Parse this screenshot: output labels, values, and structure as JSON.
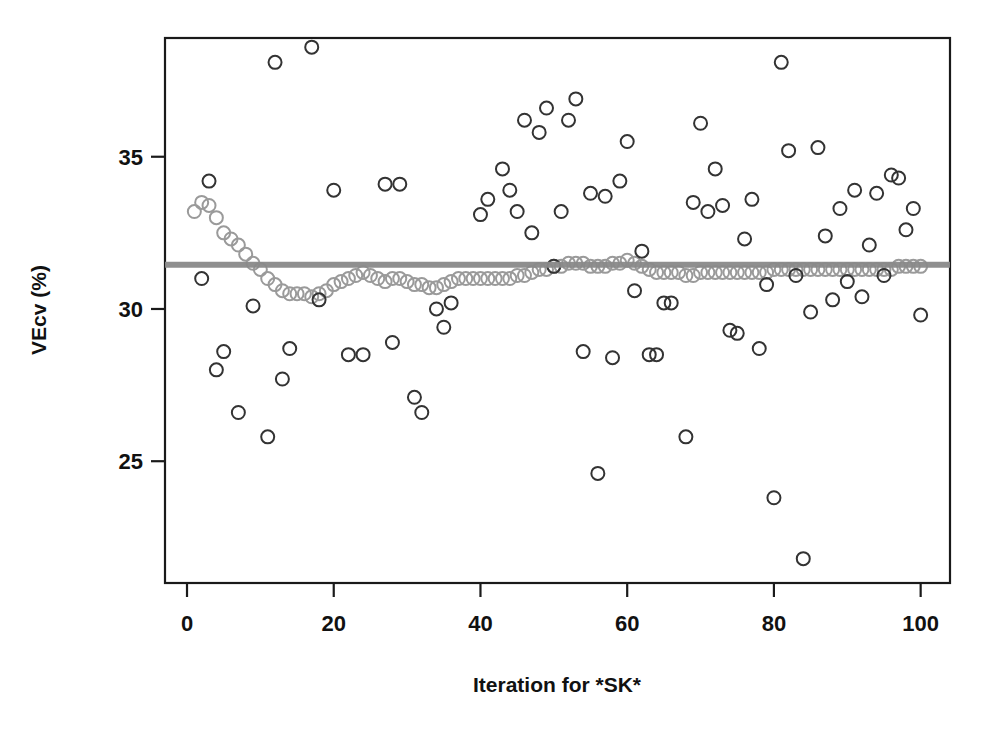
{
  "chart_data": {
    "type": "scatter",
    "title": "",
    "xlabel": "Iteration for *SK*",
    "ylabel": "VEcv (%)",
    "xlim": [
      -3,
      104
    ],
    "ylim": [
      21.0,
      38.9
    ],
    "xticks": [
      0,
      20,
      40,
      60,
      80,
      100
    ],
    "yticks": [
      25,
      30,
      35
    ],
    "grid": false,
    "legend": null,
    "colors": {
      "outlier_marker": "#333333",
      "cluster_marker": "#9a9a9a",
      "mean_line": "#8a8a8a",
      "axis": "#1a1a1a",
      "background": "#ffffff"
    },
    "marker": {
      "shape": "open-circle",
      "radius_px": 6.5,
      "stroke_width_px": 2
    },
    "reference_line": {
      "orientation": "horizontal",
      "value": 31.45,
      "label": "mean VEcv",
      "width_px": 6,
      "color": "#8a8a8a"
    },
    "series": [
      {
        "name": "cumulative mean VEcv",
        "role": "cluster",
        "color": "#9a9a9a",
        "points": [
          [
            1,
            33.2
          ],
          [
            2,
            33.5
          ],
          [
            3,
            33.4
          ],
          [
            4,
            33.0
          ],
          [
            5,
            32.5
          ],
          [
            6,
            32.3
          ],
          [
            7,
            32.1
          ],
          [
            8,
            31.8
          ],
          [
            9,
            31.5
          ],
          [
            10,
            31.3
          ],
          [
            11,
            31.0
          ],
          [
            12,
            30.8
          ],
          [
            13,
            30.6
          ],
          [
            14,
            30.5
          ],
          [
            15,
            30.5
          ],
          [
            16,
            30.5
          ],
          [
            17,
            30.4
          ],
          [
            18,
            30.5
          ],
          [
            19,
            30.6
          ],
          [
            20,
            30.8
          ],
          [
            21,
            30.9
          ],
          [
            22,
            31.0
          ],
          [
            23,
            31.1
          ],
          [
            24,
            31.2
          ],
          [
            25,
            31.1
          ],
          [
            26,
            31.0
          ],
          [
            27,
            30.9
          ],
          [
            28,
            31.0
          ],
          [
            29,
            31.0
          ],
          [
            30,
            30.9
          ],
          [
            31,
            30.8
          ],
          [
            32,
            30.8
          ],
          [
            33,
            30.7
          ],
          [
            34,
            30.7
          ],
          [
            35,
            30.8
          ],
          [
            36,
            30.9
          ],
          [
            37,
            31.0
          ],
          [
            38,
            31.0
          ],
          [
            39,
            31.0
          ],
          [
            40,
            31.0
          ],
          [
            41,
            31.0
          ],
          [
            42,
            31.0
          ],
          [
            43,
            31.0
          ],
          [
            44,
            31.0
          ],
          [
            45,
            31.1
          ],
          [
            46,
            31.1
          ],
          [
            47,
            31.2
          ],
          [
            48,
            31.3
          ],
          [
            49,
            31.3
          ],
          [
            50,
            31.4
          ],
          [
            51,
            31.4
          ],
          [
            52,
            31.5
          ],
          [
            53,
            31.5
          ],
          [
            54,
            31.5
          ],
          [
            55,
            31.4
          ],
          [
            56,
            31.4
          ],
          [
            57,
            31.4
          ],
          [
            58,
            31.5
          ],
          [
            59,
            31.5
          ],
          [
            60,
            31.6
          ],
          [
            61,
            31.5
          ],
          [
            62,
            31.4
          ],
          [
            63,
            31.3
          ],
          [
            64,
            31.2
          ],
          [
            65,
            31.2
          ],
          [
            66,
            31.2
          ],
          [
            67,
            31.2
          ],
          [
            68,
            31.1
          ],
          [
            69,
            31.1
          ],
          [
            70,
            31.2
          ],
          [
            71,
            31.2
          ],
          [
            72,
            31.2
          ],
          [
            73,
            31.2
          ],
          [
            74,
            31.2
          ],
          [
            75,
            31.2
          ],
          [
            76,
            31.2
          ],
          [
            77,
            31.2
          ],
          [
            78,
            31.2
          ],
          [
            79,
            31.2
          ],
          [
            80,
            31.3
          ],
          [
            81,
            31.3
          ],
          [
            82,
            31.3
          ],
          [
            83,
            31.3
          ],
          [
            84,
            31.3
          ],
          [
            85,
            31.3
          ],
          [
            86,
            31.3
          ],
          [
            87,
            31.3
          ],
          [
            88,
            31.3
          ],
          [
            89,
            31.3
          ],
          [
            90,
            31.3
          ],
          [
            91,
            31.3
          ],
          [
            92,
            31.3
          ],
          [
            93,
            31.3
          ],
          [
            94,
            31.3
          ],
          [
            95,
            31.3
          ],
          [
            96,
            31.3
          ],
          [
            97,
            31.4
          ],
          [
            98,
            31.4
          ],
          [
            99,
            31.4
          ],
          [
            100,
            31.4
          ]
        ]
      },
      {
        "name": "individual iteration VEcv",
        "role": "outlier",
        "color": "#333333",
        "points": [
          [
            2,
            31.0
          ],
          [
            3,
            34.2
          ],
          [
            4,
            28.0
          ],
          [
            5,
            28.6
          ],
          [
            7,
            26.6
          ],
          [
            9,
            30.1
          ],
          [
            11,
            25.8
          ],
          [
            12,
            38.1
          ],
          [
            13,
            27.7
          ],
          [
            14,
            28.7
          ],
          [
            17,
            38.6
          ],
          [
            18,
            30.3
          ],
          [
            20,
            33.9
          ],
          [
            22,
            28.5
          ],
          [
            24,
            28.5
          ],
          [
            27,
            34.1
          ],
          [
            28,
            28.9
          ],
          [
            29,
            34.1
          ],
          [
            31,
            27.1
          ],
          [
            32,
            26.6
          ],
          [
            34,
            30.0
          ],
          [
            35,
            29.4
          ],
          [
            36,
            30.2
          ],
          [
            40,
            33.1
          ],
          [
            41,
            33.6
          ],
          [
            43,
            34.6
          ],
          [
            44,
            33.9
          ],
          [
            45,
            33.2
          ],
          [
            46,
            36.2
          ],
          [
            47,
            32.5
          ],
          [
            48,
            35.8
          ],
          [
            49,
            36.6
          ],
          [
            50,
            31.4
          ],
          [
            51,
            33.2
          ],
          [
            52,
            36.2
          ],
          [
            53,
            36.9
          ],
          [
            54,
            28.6
          ],
          [
            55,
            33.8
          ],
          [
            56,
            24.6
          ],
          [
            57,
            33.7
          ],
          [
            58,
            28.4
          ],
          [
            59,
            34.2
          ],
          [
            60,
            35.5
          ],
          [
            61,
            30.6
          ],
          [
            62,
            31.9
          ],
          [
            63,
            28.5
          ],
          [
            64,
            28.5
          ],
          [
            65,
            30.2
          ],
          [
            66,
            30.2
          ],
          [
            68,
            25.8
          ],
          [
            69,
            33.5
          ],
          [
            70,
            36.1
          ],
          [
            71,
            33.2
          ],
          [
            72,
            34.6
          ],
          [
            73,
            33.4
          ],
          [
            74,
            29.3
          ],
          [
            75,
            29.2
          ],
          [
            76,
            32.3
          ],
          [
            77,
            33.6
          ],
          [
            78,
            28.7
          ],
          [
            79,
            30.8
          ],
          [
            80,
            23.8
          ],
          [
            81,
            38.1
          ],
          [
            82,
            35.2
          ],
          [
            83,
            31.1
          ],
          [
            84,
            21.8
          ],
          [
            85,
            29.9
          ],
          [
            86,
            35.3
          ],
          [
            87,
            32.4
          ],
          [
            88,
            30.3
          ],
          [
            89,
            33.3
          ],
          [
            90,
            30.9
          ],
          [
            91,
            33.9
          ],
          [
            92,
            30.4
          ],
          [
            93,
            32.1
          ],
          [
            94,
            33.8
          ],
          [
            95,
            31.1
          ],
          [
            96,
            34.4
          ],
          [
            97,
            34.3
          ],
          [
            98,
            32.6
          ],
          [
            99,
            33.3
          ],
          [
            100,
            29.8
          ]
        ]
      }
    ]
  }
}
